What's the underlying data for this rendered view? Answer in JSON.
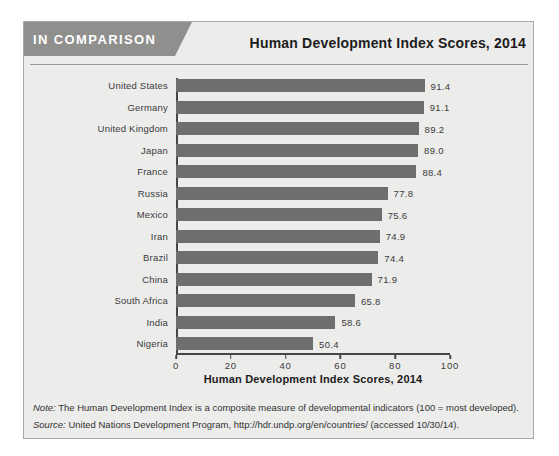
{
  "header": {
    "banner_label": "IN COMPARISON",
    "title": "Human Development Index Scores, 2014"
  },
  "chart_data": {
    "type": "bar",
    "orientation": "horizontal",
    "title": "Human Development Index Scores, 2014",
    "categories": [
      "United States",
      "Germany",
      "United Kingdom",
      "Japan",
      "France",
      "Russia",
      "Mexico",
      "Iran",
      "Brazil",
      "China",
      "South Africa",
      "India",
      "Nigeria"
    ],
    "values": [
      91.4,
      91.1,
      89.2,
      89.0,
      88.4,
      77.8,
      75.6,
      74.9,
      74.4,
      71.9,
      65.8,
      58.6,
      50.4
    ],
    "xlabel": "Human Development Index Scores, 2014",
    "ylabel": "",
    "xlim": [
      0,
      100
    ],
    "x_ticks": [
      0,
      20,
      40,
      60,
      80,
      100
    ],
    "grid": false,
    "legend": "none",
    "value_label_decimals": 1
  },
  "colors": {
    "bar": "#6e6e6c",
    "banner_bg": "#8f8f8d",
    "box_bg": "#ececeb",
    "box_border": "#a8a8a6",
    "axis": "#474745"
  },
  "footnotes": {
    "note_label": "Note:",
    "note_text": " The Human Development Index is a composite measure of developmental indicators (100 = most developed).",
    "source_label": "Source:",
    "source_text": " United Nations Development Program, http://hdr.undp.org/en/countries/ (accessed 10/30/14)."
  }
}
